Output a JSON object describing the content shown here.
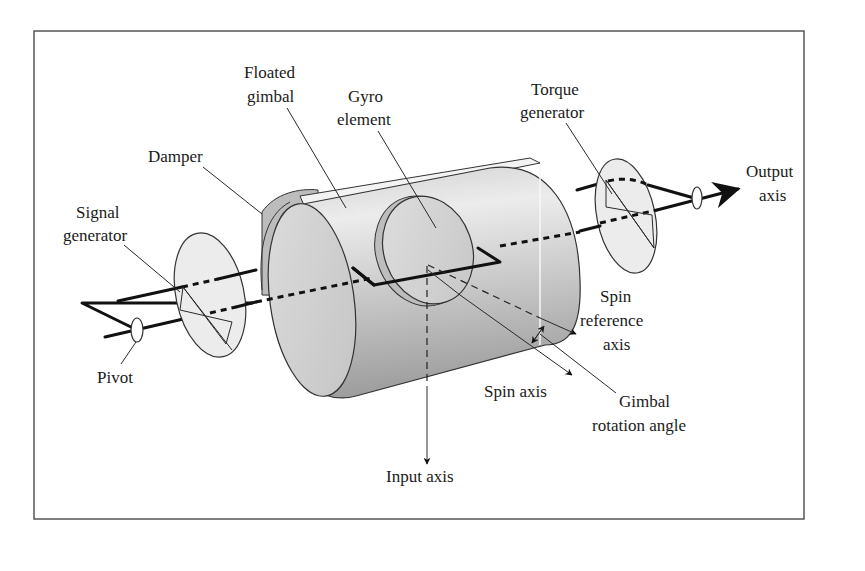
{
  "figure": {
    "frame_color": "#555555",
    "background": "#ffffff"
  },
  "labels": {
    "floated_gimbal": [
      "Floated",
      "gimbal"
    ],
    "gyro_element": [
      "Gyro",
      "element"
    ],
    "torque_generator": [
      "Torque",
      "generator"
    ],
    "damper": [
      "Damper"
    ],
    "signal_generator": [
      "Signal",
      "generator"
    ],
    "output_axis": [
      "Output",
      "axis"
    ],
    "pivot": [
      "Pivot"
    ],
    "spin_reference_axis": [
      "Spin",
      "reference",
      "axis"
    ],
    "spin_axis": [
      "Spin axis"
    ],
    "gimbal_rotation_angle": [
      "Gimbal",
      "rotation angle"
    ],
    "input_axis": [
      "Input axis"
    ]
  },
  "colors": {
    "cylinder_light": "#e6e6e6",
    "cylinder_mid": "#c9c9c9",
    "cylinder_dark": "#a8a8a8",
    "disk_fill": "#ededed",
    "end_face": "#d4d4d4",
    "line": "#111111"
  }
}
